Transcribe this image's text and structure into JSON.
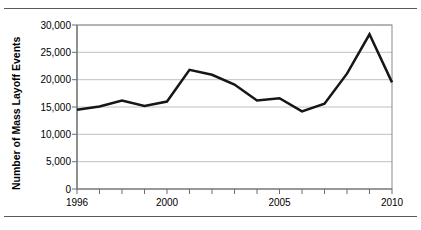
{
  "figure": {
    "top_rule": "horizontal-rule",
    "bottom_rule": "horizontal-rule"
  },
  "chart_data": {
    "type": "line",
    "title": "",
    "subtitle": "",
    "xlabel": "",
    "ylabel": "Number of Mass Layoff Events",
    "x": [
      1996,
      1997,
      1998,
      1999,
      2000,
      2001,
      2002,
      2003,
      2004,
      2005,
      2006,
      2007,
      2008,
      2009,
      2010
    ],
    "values": [
      14500,
      15100,
      16200,
      15200,
      16000,
      21800,
      20900,
      19100,
      16200,
      16600,
      14200,
      15600,
      21100,
      28300,
      19500
    ],
    "series": [
      {
        "name": "Mass Layoff Events",
        "values": [
          14500,
          15100,
          16200,
          15200,
          16000,
          21800,
          20900,
          19100,
          16200,
          16600,
          14200,
          15600,
          21100,
          28300,
          19500
        ],
        "color": "#161616"
      }
    ],
    "xlim": [
      1996,
      2010
    ],
    "ylim": [
      0,
      30000
    ],
    "x_tick_labels": [
      "1996",
      "2000",
      "2005",
      "2010"
    ],
    "x_tick_values": [
      1996,
      2000,
      2005,
      2010
    ],
    "x_minor_ticks": [
      1996,
      1997,
      1998,
      1999,
      2000,
      2001,
      2002,
      2003,
      2004,
      2005,
      2006,
      2007,
      2008,
      2009,
      2010
    ],
    "y_tick_labels": [
      "0",
      "5,000",
      "10,000",
      "15,000",
      "20,000",
      "25,000",
      "30,000"
    ],
    "y_tick_values": [
      0,
      5000,
      10000,
      15000,
      20000,
      25000,
      30000
    ],
    "grid": true,
    "grid_axis": "y",
    "legend": false,
    "legend_position": "none",
    "line_color": "#161616",
    "grid_color": "#b9b9b9",
    "axis_color": "#6e6e6e",
    "background": "#ffffff"
  }
}
